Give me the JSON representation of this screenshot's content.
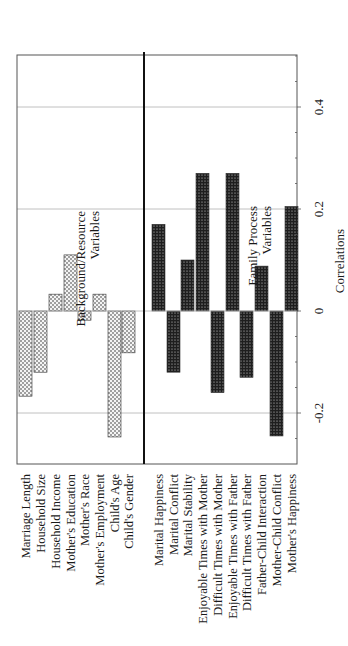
{
  "chart_data": {
    "type": "bar",
    "orientation": "rotated-90-ccw",
    "title": "",
    "xlabel": "",
    "ylabel": "Correlations",
    "ylim": [
      -0.3,
      0.5
    ],
    "yticks": [
      -0.2,
      0,
      0.2,
      0.4
    ],
    "ytick_labels": [
      "-0.2",
      "0",
      "0.2",
      "0.4"
    ],
    "minor_tick_step": 0.05,
    "grid": true,
    "legend": null,
    "groups": [
      {
        "name": "Background/Resource Variables",
        "annotation_lines": [
          "Background/Resource",
          "Variables"
        ],
        "fill": "light-dotted",
        "categories": [
          "Marriage Length",
          "Household Size",
          "Household Income",
          "Mother's Education",
          "Mother's Race",
          "Mother's Employment",
          "Child's Age",
          "Child's Gender"
        ],
        "values": [
          -0.167,
          -0.12,
          0.033,
          0.11,
          -0.018,
          0.033,
          -0.247,
          -0.082
        ]
      },
      {
        "name": "Family Process Variables",
        "annotation_lines": [
          "Family Process",
          "Variables"
        ],
        "fill": "dark-dotted",
        "categories": [
          "Marital Happiness",
          "Marital Conflict",
          "Marital Stability",
          "Enjoyable Times with Mother",
          "Difficult Times with Mother",
          "Enjoyable Times with Father",
          "Difficult Times with Father",
          "Father-Child Interaction",
          "Mother-Child Conflict",
          "Mother's Happiness"
        ],
        "values": [
          0.17,
          -0.12,
          0.1,
          0.27,
          -0.16,
          0.27,
          -0.13,
          0.088,
          -0.245,
          0.205
        ]
      }
    ]
  },
  "colors": {
    "frame": "#555555",
    "grid": "#b0b0b0",
    "divider": "#111111",
    "light_bar_fill": "#f4f4f4",
    "light_bar_dot": "#222222",
    "dark_bar_fill": "#1e1e1e",
    "dark_bar_dot": "#e8e8e8",
    "text": "#1a1a1a"
  },
  "layout": {
    "zero_y": 311,
    "px_per_unit": 510,
    "frame": {
      "left": 17,
      "right": 297,
      "top": 55,
      "bottom": 464
    },
    "divider_x": 144,
    "bar_width": 13,
    "left_bar_x": [
      19,
      34,
      49,
      64,
      78,
      93,
      108,
      122
    ],
    "right_bar_x": [
      152,
      167,
      181,
      196,
      211,
      226,
      240,
      255,
      270,
      285
    ],
    "label_top_y": 474
  }
}
